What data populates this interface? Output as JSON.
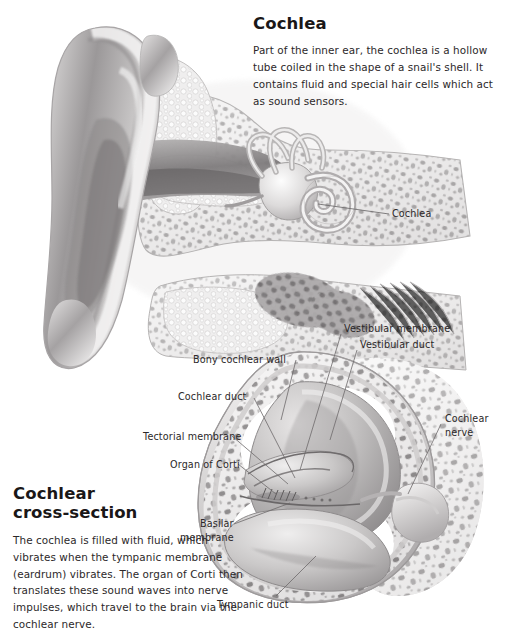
{
  "page": {
    "background": "#ffffff",
    "text_color": "#2c2829",
    "width": 507,
    "height": 638
  },
  "top_panel": {
    "heading": "Cochlea",
    "body": "Part of the inner ear, the cochlea is a hollow tube coiled in the shape of a snail's shell. It contains fluid and special hair cells which act as sound sensors."
  },
  "bottom_panel": {
    "heading": "Cochlear\ncross-section",
    "body": "The cochlea is filled with fluid, which vibrates when the tympanic membrane (eardrum) vibrates.\nThe organ of Corti then translates these sound waves into nerve impulses, which travel to the brain via the cochlear nerve."
  },
  "labels": {
    "cochlea_top": "Cochlea",
    "vestibular_membrane": "Vestibular membrane",
    "vestibular_duct": "Vestibular duct",
    "bony_cochlear_wall": "Bony cochlear wall",
    "cochlear_duct": "Cochlear duct",
    "tectorial_membrane": "Tectorial membrane",
    "organ_of_corti": "Organ of Corti",
    "basilar_membrane": "Basilar\nmembrane",
    "cochlear_nerve": "Cochlear\nnerve",
    "tympanic_duct": "Tympanic duct"
  },
  "illustration": {
    "top_figure": "ear-cross-section-grayscale",
    "bottom_figure": "cochlea-cross-section-grayscale",
    "style": "grayscale-medical-airbrush",
    "leader_line_color": "#6d6a6b"
  }
}
